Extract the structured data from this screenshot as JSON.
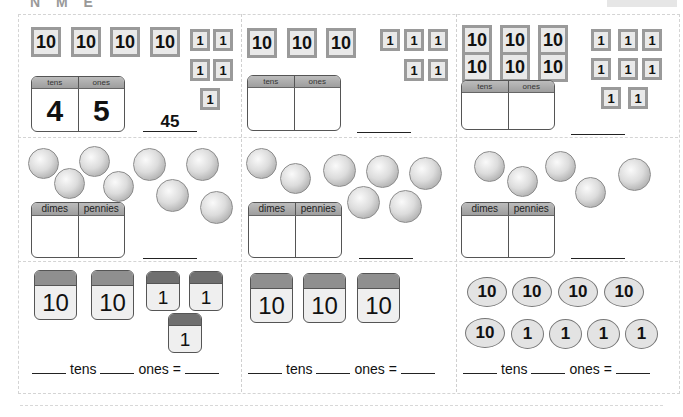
{
  "worksheet": {
    "heading_partial": "N  M  E",
    "panels_row1": [
      {
        "tens_tiles": [
          "10",
          "10",
          "10",
          "10"
        ],
        "ones_tiles": [
          "1",
          "1",
          "1",
          "1",
          "1"
        ],
        "table": {
          "col1": "tens",
          "col2": "ones",
          "val1": "4",
          "val2": "5"
        },
        "answer": "45"
      },
      {
        "tens_tiles": [
          "10",
          "10",
          "10"
        ],
        "ones_tiles": [
          "1",
          "1",
          "1",
          "1",
          "1"
        ],
        "table": {
          "col1": "tens",
          "col2": "ones",
          "val1": "",
          "val2": ""
        },
        "answer": ""
      },
      {
        "tens_tiles": [
          "10",
          "10",
          "10",
          "10",
          "10",
          "10"
        ],
        "ones_tiles": [
          "1",
          "1",
          "1",
          "1",
          "1",
          "1",
          "1",
          "1"
        ],
        "table": {
          "col1": "tens",
          "col2": "ones",
          "val1": "",
          "val2": ""
        },
        "answer": ""
      }
    ],
    "panels_row2": [
      {
        "coins": [
          "dime-queen",
          "dime-boat",
          "dime-boat",
          "dime-queen",
          "penny-queen",
          "penny-maple",
          "penny-maple",
          "penny-queen"
        ],
        "table": {
          "col1": "dimes",
          "col2": "pennies"
        },
        "answer": ""
      },
      {
        "coins": [
          "dime-queen",
          "dime-boat",
          "penny-queen",
          "penny-maple",
          "penny-queen",
          "penny-maple",
          "penny-queen"
        ],
        "table": {
          "col1": "dimes",
          "col2": "pennies"
        },
        "answer": ""
      },
      {
        "coins": [
          "dime-queen",
          "dime-boat",
          "dime-queen",
          "dime-boat",
          "penny-maple"
        ],
        "table": {
          "col1": "dimes",
          "col2": "pennies"
        },
        "answer": ""
      }
    ],
    "panels_row3": [
      {
        "blocks": [
          "10",
          "10",
          "1",
          "1",
          "1"
        ],
        "equation": {
          "tens_label": "tens",
          "ones_label": "ones",
          "equals": "="
        }
      },
      {
        "blocks": [
          "10",
          "10",
          "10"
        ],
        "equation": {
          "tens_label": "tens",
          "ones_label": "ones",
          "equals": "="
        }
      },
      {
        "ovals": [
          "10",
          "10",
          "10",
          "10",
          "10",
          "1",
          "1",
          "1",
          "1"
        ],
        "equation": {
          "tens_label": "tens",
          "ones_label": "ones",
          "equals": "="
        }
      }
    ]
  }
}
